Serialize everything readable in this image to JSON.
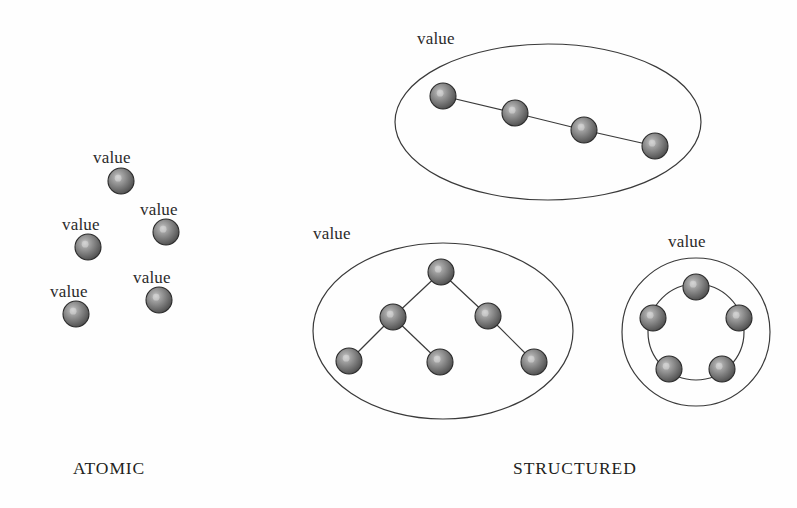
{
  "figure": {
    "background_color": "#fefefe",
    "ink_color": "#231f20",
    "sphere": {
      "fill_center": "#b9b9b9",
      "fill_mid": "#7d7d7d",
      "fill_edge": "#4a4a4a",
      "stroke": "#2b2b2b",
      "radius": 13,
      "highlight_offset": [
        -0.18,
        -0.18
      ]
    },
    "outline": {
      "stroke": "#3a3a3a",
      "width": 1.2,
      "fill": "none"
    },
    "edge": {
      "stroke": "#3a3a3a",
      "width": 1.2
    }
  },
  "captions": [
    {
      "id": "atomic",
      "text": "ATOMIC",
      "x": 73,
      "y": 458
    },
    {
      "id": "structured",
      "text": "STRUCTURED",
      "x": 513,
      "y": 458
    }
  ],
  "atomic": {
    "caption": "ATOMIC",
    "label_text": "value",
    "nodes": [
      {
        "id": "a1",
        "cx": 121,
        "cy": 181,
        "label_x": 93,
        "label_y": 148
      },
      {
        "id": "a2",
        "cx": 166,
        "cy": 232,
        "label_x": 140,
        "label_y": 200
      },
      {
        "id": "a3",
        "cx": 88,
        "cy": 247,
        "label_x": 62,
        "label_y": 215
      },
      {
        "id": "a4",
        "cx": 159,
        "cy": 300,
        "label_x": 133,
        "label_y": 268
      },
      {
        "id": "a5",
        "cx": 76,
        "cy": 314,
        "label_x": 50,
        "label_y": 282
      }
    ]
  },
  "structured": {
    "caption": "STRUCTURED",
    "groups": [
      {
        "id": "chain",
        "label_text": "value",
        "label_x": 417,
        "label_y": 29,
        "shape": "ellipse",
        "outline": {
          "cx": 548,
          "cy": 122,
          "rx": 153,
          "ry": 78
        },
        "nodes": [
          {
            "id": "c1",
            "cx": 443,
            "cy": 96
          },
          {
            "id": "c2",
            "cx": 515,
            "cy": 113
          },
          {
            "id": "c3",
            "cx": 584,
            "cy": 130
          },
          {
            "id": "c4",
            "cx": 655,
            "cy": 146
          }
        ],
        "edges": [
          [
            "c1",
            "c2"
          ],
          [
            "c2",
            "c3"
          ],
          [
            "c3",
            "c4"
          ]
        ]
      },
      {
        "id": "tree",
        "label_text": "value",
        "label_x": 313,
        "label_y": 224,
        "shape": "ellipse",
        "outline": {
          "cx": 443,
          "cy": 331,
          "rx": 130,
          "ry": 88
        },
        "nodes": [
          {
            "id": "t1",
            "cx": 441,
            "cy": 272
          },
          {
            "id": "t2",
            "cx": 393,
            "cy": 317
          },
          {
            "id": "t3",
            "cx": 488,
            "cy": 316
          },
          {
            "id": "t4",
            "cx": 349,
            "cy": 361
          },
          {
            "id": "t5",
            "cx": 440,
            "cy": 362
          },
          {
            "id": "t6",
            "cx": 534,
            "cy": 362
          }
        ],
        "edges": [
          [
            "t1",
            "t2"
          ],
          [
            "t1",
            "t3"
          ],
          [
            "t2",
            "t4"
          ],
          [
            "t2",
            "t5"
          ],
          [
            "t3",
            "t6"
          ]
        ]
      },
      {
        "id": "ring",
        "label_text": "value",
        "label_x": 668,
        "label_y": 232,
        "shape": "circle",
        "outline": {
          "cx": 696,
          "cy": 332,
          "rx": 74,
          "ry": 74
        },
        "ring_arc_radius": 48,
        "nodes": [
          {
            "id": "r1",
            "cx": 696,
            "cy": 287
          },
          {
            "id": "r2",
            "cx": 739,
            "cy": 318
          },
          {
            "id": "r3",
            "cx": 722,
            "cy": 369
          },
          {
            "id": "r4",
            "cx": 669,
            "cy": 369
          },
          {
            "id": "r5",
            "cx": 653,
            "cy": 318
          }
        ],
        "edges": [
          [
            "r1",
            "r2"
          ],
          [
            "r2",
            "r3"
          ],
          [
            "r3",
            "r4"
          ],
          [
            "r4",
            "r5"
          ],
          [
            "r5",
            "r1"
          ]
        ]
      }
    ]
  }
}
